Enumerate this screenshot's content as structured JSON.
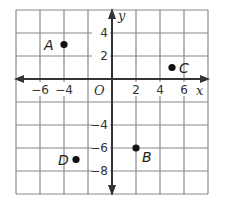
{
  "diagram": {
    "type": "coordinate-plane",
    "grid": {
      "x_min": -8,
      "x_max": 8,
      "y_min": -10,
      "y_max": 6,
      "unit_per_square": 2,
      "x_ticks": [
        {
          "value": -6,
          "label": "−6"
        },
        {
          "value": -4,
          "label": "−4"
        },
        {
          "value": 2,
          "label": "2"
        },
        {
          "value": 4,
          "label": "4"
        },
        {
          "value": 6,
          "label": "6"
        }
      ],
      "y_ticks": [
        {
          "value": 4,
          "label": "4"
        },
        {
          "value": 2,
          "label": "2"
        },
        {
          "value": -4,
          "label": "−4"
        },
        {
          "value": -6,
          "label": "−6"
        },
        {
          "value": -8,
          "label": "−8"
        }
      ],
      "origin_label": "O",
      "x_axis_label": "x",
      "y_axis_label": "y"
    },
    "points": [
      {
        "name": "A",
        "x": -4,
        "y": 3
      },
      {
        "name": "B",
        "x": 2,
        "y": -6
      },
      {
        "name": "C",
        "x": 5,
        "y": 1
      },
      {
        "name": "D",
        "x": -3,
        "y": -7
      }
    ],
    "colors": {
      "grid": "#8a8a8a",
      "axis": "#333333",
      "point": "#111111"
    }
  }
}
